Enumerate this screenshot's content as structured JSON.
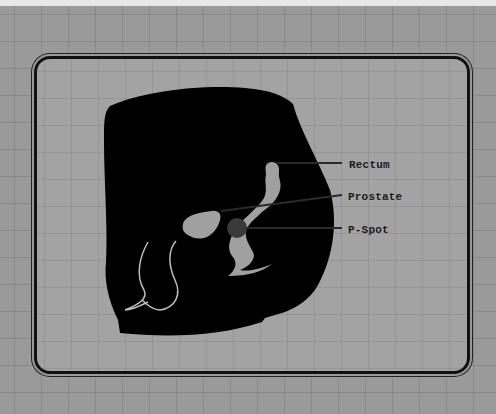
{
  "diagram": {
    "title": "",
    "labels": [
      {
        "id": "rectum",
        "text": "Rectum"
      },
      {
        "id": "prostate",
        "text": "Prostate"
      },
      {
        "id": "p-spot",
        "text": "P-Spot"
      }
    ],
    "colors": {
      "background": "#9a9a9a",
      "silhouette": "#000000",
      "organ_fill": "#a0a0a0",
      "p_spot": "#3a3a3a",
      "leader_line": "#2a2a2a"
    }
  }
}
